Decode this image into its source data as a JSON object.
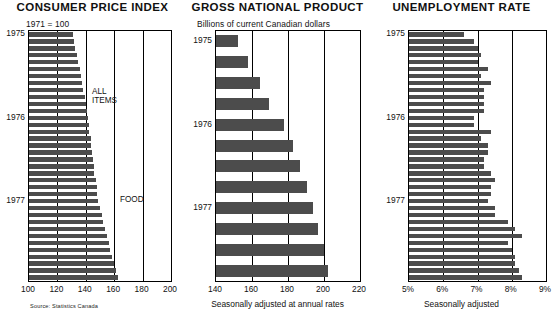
{
  "panels": [
    {
      "title": "CONSUMER PRICE INDEX",
      "subtitle": "1971 = 100",
      "source": "Source: Statistics Canada",
      "notes": [
        {
          "text": "ALL",
          "x": 92,
          "y": 88
        },
        {
          "text": "ITEMS",
          "x": 92,
          "y": 97
        },
        {
          "text": "FOOD",
          "x": 120,
          "y": 196
        }
      ],
      "year_labels": [
        {
          "label": "1975",
          "index": 0
        },
        {
          "label": "1976",
          "index": 12
        },
        {
          "label": "1977",
          "index": 24
        }
      ]
    },
    {
      "title": "GROSS NATIONAL PRODUCT",
      "subtitle": "Billions of current Canadian dollars",
      "caption": "Seasonally adjusted at annual rates",
      "year_labels": [
        {
          "label": "1975",
          "index": 0
        },
        {
          "label": "1976",
          "index": 4
        },
        {
          "label": "1977",
          "index": 8
        }
      ]
    },
    {
      "title": "UNEMPLOYMENT RATE",
      "caption": "Seasonally adjusted",
      "year_labels": [
        {
          "label": "1975",
          "index": 0
        },
        {
          "label": "1976",
          "index": 12
        },
        {
          "label": "1977",
          "index": 24
        }
      ]
    }
  ],
  "chart_data": [
    {
      "type": "bar",
      "orientation": "horizontal",
      "title": "Consumer Price Index",
      "subtitle": "1971 = 100",
      "xlabel": "",
      "ylabel": "",
      "xlim": [
        100,
        200
      ],
      "xticks": [
        100,
        120,
        140,
        160,
        180,
        200
      ],
      "xticklabels": [
        "100",
        "120",
        "140",
        "160",
        "180",
        "200"
      ],
      "grid": true,
      "categories": [
        "1975-01",
        "1975-02",
        "1975-03",
        "1975-04",
        "1975-05",
        "1975-06",
        "1975-07",
        "1975-08",
        "1975-09",
        "1975-10",
        "1975-11",
        "1975-12",
        "1976-01",
        "1976-02",
        "1976-03",
        "1976-04",
        "1976-05",
        "1976-06",
        "1976-07",
        "1976-08",
        "1976-09",
        "1976-10",
        "1976-11",
        "1976-12",
        "1977-01",
        "1977-02",
        "1977-03",
        "1977-04",
        "1977-05",
        "1977-06",
        "1977-07",
        "1977-08",
        "1977-09",
        "1977-10",
        "1977-11",
        "1977-12"
      ],
      "values": [
        131.0,
        131.8,
        132.5,
        133.5,
        134.5,
        135.6,
        136.8,
        137.5,
        138.2,
        139.5,
        140.3,
        141.0,
        141.8,
        142.2,
        142.6,
        143.4,
        144.0,
        144.5,
        145.2,
        145.6,
        146.1,
        147.0,
        147.6,
        148.0,
        148.9,
        150.0,
        151.1,
        152.0,
        153.5,
        155.0,
        156.3,
        157.0,
        158.6,
        160.0,
        161.2,
        162.5
      ],
      "annotations": [
        "ALL ITEMS",
        "FOOD"
      ],
      "source": "Source: Statistics Canada"
    },
    {
      "type": "bar",
      "orientation": "horizontal",
      "title": "Gross National Product",
      "subtitle": "Billions of current Canadian dollars",
      "xlabel": "Seasonally adjusted at annual rates",
      "ylabel": "",
      "xlim": [
        140,
        220
      ],
      "xticks": [
        140,
        160,
        180,
        200,
        220
      ],
      "xticklabels": [
        "140",
        "160",
        "180",
        "200",
        "220"
      ],
      "grid": true,
      "categories": [
        "1975-Q1",
        "1975-Q2",
        "1975-Q3",
        "1975-Q4",
        "1976-Q1",
        "1976-Q2",
        "1976-Q3",
        "1976-Q4",
        "1977-Q1",
        "1977-Q2",
        "1977-Q3",
        "1977-Q4"
      ],
      "values": [
        152.0,
        157.5,
        164.5,
        169.5,
        177.5,
        182.5,
        186.5,
        190.5,
        194.0,
        196.5,
        200.0,
        202.0
      ]
    },
    {
      "type": "bar",
      "orientation": "horizontal",
      "title": "Unemployment Rate",
      "xlabel": "Seasonally adjusted",
      "ylabel": "",
      "xlim": [
        5,
        9
      ],
      "xticks": [
        5,
        6,
        7,
        8,
        9
      ],
      "xticklabels": [
        "5%",
        "6%",
        "7%",
        "8%",
        "9%"
      ],
      "grid": true,
      "categories": [
        "1975-01",
        "1975-02",
        "1975-03",
        "1975-04",
        "1975-05",
        "1975-06",
        "1975-07",
        "1975-08",
        "1975-09",
        "1975-10",
        "1975-11",
        "1975-12",
        "1976-01",
        "1976-02",
        "1976-03",
        "1976-04",
        "1976-05",
        "1976-06",
        "1976-07",
        "1976-08",
        "1976-09",
        "1976-10",
        "1976-11",
        "1976-12",
        "1977-01",
        "1977-02",
        "1977-03",
        "1977-04",
        "1977-05",
        "1977-06",
        "1977-07",
        "1977-08",
        "1977-09",
        "1977-10",
        "1977-11",
        "1977-12"
      ],
      "values": [
        6.6,
        6.9,
        7.0,
        7.1,
        7.0,
        7.3,
        7.1,
        7.4,
        7.2,
        7.2,
        7.2,
        7.2,
        6.9,
        6.9,
        7.4,
        7.1,
        7.3,
        7.3,
        7.2,
        7.2,
        7.4,
        7.5,
        7.4,
        7.4,
        7.3,
        7.5,
        7.5,
        7.9,
        8.1,
        8.3,
        7.9,
        8.0,
        8.1,
        8.1,
        8.2,
        8.3
      ]
    }
  ]
}
